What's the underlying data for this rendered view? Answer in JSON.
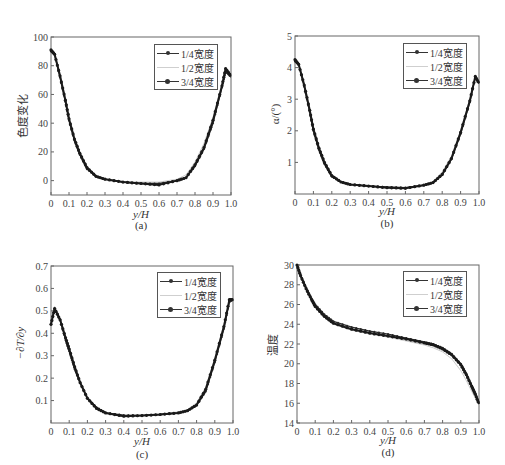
{
  "legend_labels": [
    "1/4宽度",
    "1/2宽度",
    "3/4宽度"
  ],
  "series_colors": [
    "#2b2b2b",
    "#cccccc",
    "#1a1a1a"
  ],
  "chart_data": [
    {
      "type": "line",
      "caption": "(a)",
      "title": "",
      "xlabel": "y/H",
      "ylabel": "色度变化",
      "xlim": [
        0,
        1.0
      ],
      "ylim": [
        -10,
        100
      ],
      "xticks": [
        "0",
        "0.1",
        "0.2",
        "0.3",
        "0.4",
        "0.5",
        "0.6",
        "0.7",
        "0.8",
        "0.9",
        "1.0"
      ],
      "yticks": [
        "0",
        "20",
        "40",
        "60",
        "80",
        "100"
      ],
      "ytick_values": [
        0,
        20,
        40,
        60,
        80,
        100
      ],
      "legend_position": "upper right",
      "grid": false,
      "x": [
        0,
        0.02,
        0.05,
        0.08,
        0.1,
        0.13,
        0.16,
        0.2,
        0.25,
        0.3,
        0.4,
        0.5,
        0.6,
        0.7,
        0.75,
        0.8,
        0.85,
        0.9,
        0.95,
        0.97,
        1.0
      ],
      "series": [
        {
          "name": "1/4宽度",
          "values": [
            90,
            88,
            72,
            55,
            42,
            28,
            18,
            8,
            3,
            1,
            -1,
            -2,
            -2,
            0,
            2,
            10,
            22,
            40,
            65,
            76,
            72
          ]
        },
        {
          "name": "1/2宽度",
          "values": [
            92,
            89,
            75,
            58,
            45,
            31,
            20,
            10,
            4,
            1,
            -1,
            -1,
            -1,
            1,
            4,
            13,
            26,
            44,
            68,
            77,
            73
          ]
        },
        {
          "name": "3/4宽度",
          "values": [
            91,
            88,
            73,
            56,
            43,
            29,
            19,
            9,
            3,
            1,
            -1,
            -2,
            -3,
            0,
            2,
            11,
            23,
            42,
            66,
            78,
            73
          ]
        }
      ]
    },
    {
      "type": "line",
      "caption": "(b)",
      "title": "",
      "xlabel": "y/H",
      "ylabel": "α/(°)",
      "xlim": [
        0,
        1.0
      ],
      "ylim": [
        0,
        5
      ],
      "xticks": [
        "0",
        "0.1",
        "0.2",
        "0.3",
        "0.4",
        "0.5",
        "0.6",
        "0.7",
        "0.8",
        "0.9",
        "1.0"
      ],
      "yticks": [
        "1",
        "2",
        "3",
        "4",
        "5"
      ],
      "ytick_values": [
        1,
        2,
        3,
        4,
        5
      ],
      "legend_position": "upper right",
      "grid": false,
      "x": [
        0,
        0.02,
        0.05,
        0.08,
        0.1,
        0.13,
        0.16,
        0.2,
        0.25,
        0.3,
        0.4,
        0.5,
        0.6,
        0.7,
        0.75,
        0.8,
        0.85,
        0.9,
        0.95,
        0.98,
        1.0
      ],
      "series": [
        {
          "name": "1/4宽度",
          "values": [
            4.2,
            4.1,
            3.4,
            2.6,
            2.0,
            1.4,
            0.95,
            0.55,
            0.38,
            0.3,
            0.25,
            0.22,
            0.2,
            0.28,
            0.35,
            0.6,
            1.1,
            1.9,
            2.9,
            3.7,
            3.5
          ]
        },
        {
          "name": "1/2宽度",
          "values": [
            4.3,
            4.15,
            3.5,
            2.75,
            2.15,
            1.55,
            1.05,
            0.62,
            0.4,
            0.3,
            0.25,
            0.22,
            0.2,
            0.3,
            0.4,
            0.7,
            1.2,
            2.0,
            3.0,
            3.7,
            3.55
          ]
        },
        {
          "name": "3/4宽度",
          "values": [
            4.25,
            4.1,
            3.45,
            2.65,
            2.05,
            1.45,
            1.0,
            0.58,
            0.38,
            0.3,
            0.25,
            0.2,
            0.18,
            0.28,
            0.36,
            0.62,
            1.12,
            1.95,
            2.95,
            3.72,
            3.5
          ]
        }
      ]
    },
    {
      "type": "line",
      "caption": "(c)",
      "title": "",
      "xlabel": "y/H",
      "ylabel": "−∂T/∂y",
      "xlim": [
        0,
        1.0
      ],
      "ylim": [
        0,
        0.7
      ],
      "xticks": [
        "0",
        "0.1",
        "0.2",
        "0.3",
        "0.4",
        "0.5",
        "0.6",
        "0.7",
        "0.8",
        "0.9",
        "1.0"
      ],
      "yticks": [
        "0.1",
        "0.2",
        "0.3",
        "0.4",
        "0.5",
        "0.6",
        "0.7"
      ],
      "ytick_values": [
        0.1,
        0.2,
        0.3,
        0.4,
        0.5,
        0.6,
        0.7
      ],
      "legend_position": "upper right",
      "grid": false,
      "x": [
        0,
        0.02,
        0.05,
        0.08,
        0.1,
        0.13,
        0.16,
        0.2,
        0.25,
        0.3,
        0.4,
        0.5,
        0.6,
        0.7,
        0.75,
        0.8,
        0.85,
        0.9,
        0.95,
        0.98,
        1.0
      ],
      "series": [
        {
          "name": "1/4宽度",
          "values": [
            0.44,
            0.51,
            0.46,
            0.37,
            0.32,
            0.24,
            0.18,
            0.11,
            0.07,
            0.045,
            0.035,
            0.033,
            0.038,
            0.045,
            0.055,
            0.08,
            0.14,
            0.27,
            0.42,
            0.54,
            0.55
          ]
        },
        {
          "name": "1/2宽度",
          "values": [
            0.45,
            0.52,
            0.47,
            0.39,
            0.34,
            0.26,
            0.19,
            0.12,
            0.07,
            0.045,
            0.035,
            0.033,
            0.04,
            0.05,
            0.06,
            0.09,
            0.16,
            0.29,
            0.44,
            0.54,
            0.55
          ]
        },
        {
          "name": "3/4宽度",
          "values": [
            0.44,
            0.51,
            0.46,
            0.38,
            0.33,
            0.25,
            0.18,
            0.11,
            0.065,
            0.045,
            0.03,
            0.033,
            0.038,
            0.045,
            0.055,
            0.08,
            0.15,
            0.28,
            0.43,
            0.55,
            0.55
          ]
        }
      ]
    },
    {
      "type": "line",
      "caption": "(d)",
      "title": "",
      "xlabel": "y/H",
      "ylabel": "温度",
      "xlim": [
        0,
        1.0
      ],
      "ylim": [
        14,
        30
      ],
      "xticks": [
        "0",
        "0.1",
        "0.2",
        "0.3",
        "0.4",
        "0.5",
        "0.6",
        "0.7",
        "0.8",
        "0.9",
        "1.0"
      ],
      "yticks": [
        "14",
        "16",
        "18",
        "20",
        "22",
        "24",
        "26",
        "28",
        "30"
      ],
      "ytick_values": [
        14,
        16,
        18,
        20,
        22,
        24,
        26,
        28,
        30
      ],
      "legend_position": "upper right",
      "grid": false,
      "x": [
        0,
        0.02,
        0.05,
        0.08,
        0.1,
        0.15,
        0.2,
        0.3,
        0.4,
        0.5,
        0.6,
        0.7,
        0.75,
        0.8,
        0.85,
        0.9,
        0.93,
        0.96,
        0.98,
        1.0
      ],
      "series": [
        {
          "name": "1/4宽度",
          "values": [
            30.0,
            29.0,
            27.7,
            26.6,
            26.0,
            25.0,
            24.3,
            23.7,
            23.3,
            23.0,
            22.6,
            22.2,
            22.0,
            21.6,
            21.0,
            20.0,
            19.0,
            17.8,
            17.0,
            16.0
          ]
        },
        {
          "name": "1/2宽度",
          "values": [
            30.0,
            28.9,
            27.5,
            26.4,
            25.7,
            24.7,
            24.0,
            23.4,
            23.0,
            22.7,
            22.3,
            21.9,
            21.6,
            21.2,
            20.5,
            19.3,
            18.3,
            17.2,
            16.5,
            15.8
          ]
        },
        {
          "name": "3/4宽度",
          "values": [
            30.0,
            28.9,
            27.6,
            26.5,
            25.8,
            24.8,
            24.1,
            23.5,
            23.1,
            22.8,
            22.5,
            22.1,
            21.9,
            21.5,
            20.9,
            19.9,
            18.9,
            17.7,
            16.9,
            15.9
          ]
        }
      ]
    }
  ]
}
